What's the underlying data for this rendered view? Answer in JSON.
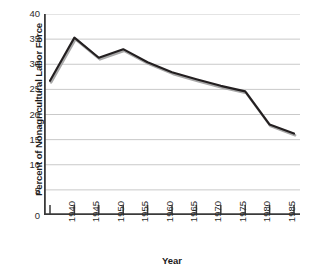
{
  "chart_data": {
    "type": "line",
    "title": "",
    "xlabel": "Year",
    "ylabel": "Percent of Nonagricultural Labor Force",
    "x": [
      1940,
      1945,
      1950,
      1955,
      1960,
      1965,
      1970,
      1975,
      1980,
      1985,
      1990
    ],
    "categories": [
      "1940",
      "1945",
      "1950",
      "1955",
      "1960",
      "1965",
      "1970",
      "1975",
      "1980",
      "1985",
      "1990"
    ],
    "values": [
      26.7,
      35.3,
      31.3,
      33.0,
      30.4,
      28.4,
      27.0,
      25.7,
      24.6,
      18.0,
      16.2
    ],
    "series": [
      {
        "name": "Percent of Nonagricultural Labor Force",
        "values": [
          26.7,
          35.3,
          31.3,
          33.0,
          30.4,
          28.4,
          27.0,
          25.7,
          24.6,
          18.0,
          16.2
        ]
      }
    ],
    "ylim": [
      0,
      40
    ],
    "ytick_labels": [
      "0",
      "5",
      "10",
      "15",
      "20",
      "25",
      "30",
      "35",
      "40"
    ],
    "ytick_values": [
      0,
      5,
      10,
      15,
      20,
      25,
      30,
      35,
      40
    ],
    "xlim": [
      1940,
      1990
    ],
    "grid": "horizontal",
    "legend": "none",
    "line_color": "#231f20",
    "shadow_color": "#a8a8a8",
    "grid_color": "#c9c9c9",
    "axis_color": "#3a3a3a"
  }
}
